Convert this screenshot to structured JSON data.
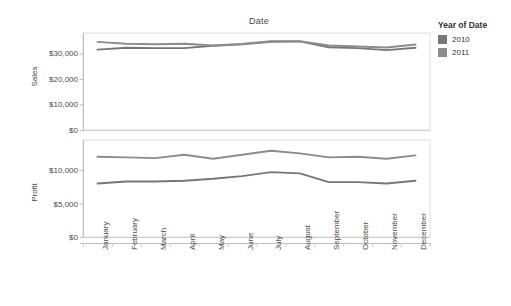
{
  "chart_data": {
    "type": "line",
    "title": "Date",
    "xlabel": "Date",
    "categories": [
      "January",
      "February",
      "March",
      "April",
      "May",
      "June",
      "July",
      "August",
      "September",
      "October",
      "November",
      "December"
    ],
    "grid": false,
    "legend": {
      "position": "right",
      "title": "Year of Date",
      "entries": [
        {
          "name": "2010",
          "color": "#777777"
        },
        {
          "name": "2011",
          "color": "#8c8c8c"
        }
      ]
    },
    "panels": [
      {
        "id": "sales",
        "ylabel": "Sales",
        "ylim": [
          0,
          38000
        ],
        "yticks": [
          0,
          10000,
          20000,
          30000
        ],
        "ytick_labels": [
          "$0",
          "$10,000",
          "$20,000",
          "$30,000"
        ],
        "series": [
          {
            "name": "2010",
            "color": "#777777",
            "values": [
              31500,
              32200,
              32100,
              32100,
              33000,
              33600,
              34600,
              34700,
              32400,
              32100,
              31300,
              32200
            ]
          },
          {
            "name": "2011",
            "color": "#8c8c8c",
            "values": [
              34500,
              33800,
              33600,
              33800,
              33100,
              33700,
              34800,
              34800,
              33100,
              32700,
              32300,
              33500
            ]
          }
        ]
      },
      {
        "id": "profit",
        "ylabel": "Profit",
        "ylim": [
          0,
          14500
        ],
        "yticks": [
          0,
          5000,
          10000
        ],
        "ytick_labels": [
          "$0",
          "$5,000",
          "$10,000"
        ],
        "series": [
          {
            "name": "2010",
            "color": "#777777",
            "values": [
              8000,
              8300,
              8300,
              8400,
              8700,
              9100,
              9700,
              9500,
              8200,
              8200,
              8000,
              8400
            ]
          },
          {
            "name": "2011",
            "color": "#8c8c8c",
            "values": [
              12000,
              11900,
              11800,
              12300,
              11700,
              12300,
              12900,
              12500,
              11900,
              12000,
              11700,
              12200
            ]
          }
        ]
      }
    ]
  }
}
